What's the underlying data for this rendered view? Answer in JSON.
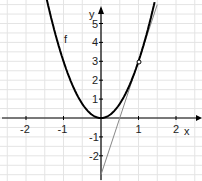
{
  "chart_data": {
    "type": "line",
    "title": "",
    "xlabel": "x",
    "ylabel": "y",
    "xlim": [
      -2.6,
      2.5
    ],
    "ylim": [
      -3,
      6
    ],
    "x_ticks": [
      "-2",
      "-1",
      "1",
      "2"
    ],
    "y_ticks": [
      "-2",
      "-1",
      "1",
      "2",
      "3",
      "4",
      "5"
    ],
    "grid": true,
    "series": [
      {
        "name": "f",
        "expression": "f(x)=3x^2",
        "color": "#000000"
      },
      {
        "name": "tangent",
        "expression": "y=6x-3",
        "color": "#888888"
      }
    ],
    "points": [
      {
        "x": 1,
        "y": 3,
        "marker": "open-circle"
      }
    ],
    "annotations": [
      {
        "text": "f",
        "x": -1,
        "y": 4.3
      }
    ]
  },
  "labels": {
    "f": "f",
    "x": "x",
    "y": "y",
    "xt": [
      "-2",
      "-1",
      "1",
      "2"
    ],
    "yt": [
      "5",
      "4",
      "3",
      "2",
      "1",
      "-1",
      "-2"
    ]
  }
}
